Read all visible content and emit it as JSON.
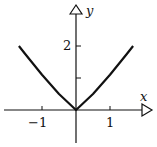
{
  "chart_data": {
    "type": "line",
    "title": "",
    "xlabel": "x",
    "ylabel": "y",
    "x_ticks": [
      -1,
      1
    ],
    "x_tick_labels": [
      "−1",
      "1"
    ],
    "y_ticks": [
      1,
      2
    ],
    "y_tick_labels": [
      "",
      "2"
    ],
    "xlim": [
      -2.1,
      2.2
    ],
    "ylim": [
      -1.3,
      3.2
    ],
    "grid": false,
    "legend": null,
    "series": [
      {
        "name": "curve",
        "color": "#111111",
        "x": [
          -1.68,
          -1.5,
          -1.0,
          -0.5,
          0,
          0.5,
          1.0,
          1.5,
          1.68
        ],
        "y": [
          2.0,
          1.76,
          1.1,
          0.5,
          0,
          0.5,
          1.1,
          1.76,
          2.0
        ]
      }
    ]
  },
  "axes": {
    "x_label": "x",
    "y_label": "y",
    "x_tick_neg1": "−1",
    "x_tick_1": "1",
    "y_tick_2": "2"
  }
}
